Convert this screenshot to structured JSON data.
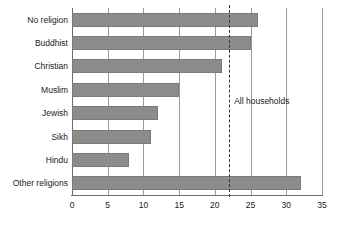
{
  "chart_data": {
    "type": "bar",
    "orientation": "horizontal",
    "title": "",
    "xlabel": "",
    "ylabel": "",
    "categories": [
      "No religion",
      "Buddhist",
      "Christian",
      "Muslim",
      "Jewish",
      "Sikh",
      "Hindu",
      "Other religions"
    ],
    "values": [
      26,
      25,
      21,
      15,
      12,
      11,
      8,
      32
    ],
    "xlim": [
      0,
      35
    ],
    "xticks": [
      0,
      5,
      10,
      15,
      20,
      25,
      30,
      35
    ],
    "xtick_labels": [
      "0",
      "5",
      "10",
      "15",
      "20",
      "25",
      "30",
      "35"
    ],
    "grid": "vertical",
    "legend": "none",
    "bar_color": "#8c8c8c",
    "annotations": [
      {
        "label": "All households",
        "value": 22,
        "style": "dashed-vertical-line"
      }
    ]
  }
}
